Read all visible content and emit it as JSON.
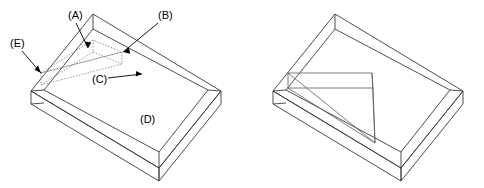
{
  "figure": {
    "background_color": "#ffffff",
    "line_color": "#3a3a3a",
    "hidden_line_color": "#7d7d7d",
    "label_color": "#000000",
    "views": [
      {
        "name": "left-view",
        "description": "Open rectangular tray with hidden (dotted) wedge outline inside"
      },
      {
        "name": "right-view",
        "description": "Open rectangular tray with solid wedge insert inside"
      }
    ]
  },
  "callouts": [
    {
      "id": "A",
      "label": "(A)",
      "text_x": 68,
      "text_y": 16,
      "leader": "M 76 23 L 88 48",
      "head_points": "88,48 84.6,41.6 91.4,42.4",
      "has_leader": true
    },
    {
      "id": "B",
      "label": "(B)",
      "text_x": 158,
      "text_y": 16,
      "leader": "M 158 23 L 123 52",
      "head_points": "123,52 128.8,47.6 130.2,53.8",
      "has_leader": true
    },
    {
      "id": "C",
      "label": "(C)",
      "text_x": 92,
      "text_y": 80,
      "leader": "M 108 78 L 142 74",
      "head_points": "142,74 135.8,76.6 136.2,71.0",
      "has_leader": true
    },
    {
      "id": "D",
      "label": "(D)",
      "text_x": 140,
      "text_y": 120,
      "leader": "",
      "head_points": "",
      "has_leader": false
    },
    {
      "id": "E",
      "label": "(E)",
      "text_x": 10,
      "text_y": 44,
      "leader": "M 22 51 L 41 73",
      "head_points": "41,73 34.6,69.8 38.0,65.6",
      "has_leader": true
    }
  ],
  "geometry": {
    "left_view": {
      "outer_rim_top": "M 31 91 L 93 14 L 221 91 L 159 168 Z",
      "inner_rim_top": "M 44 90 L 93 29 L 208 90 L 159 152 Z",
      "outer_wall_left": "M 31 91 L 31 104 L 159 181 L 159 168 Z",
      "outer_wall_right": "M 159 168 L 159 181 L 221 104 L 221 91 Z",
      "corner_vertical_back": "M 93 14 L 93 29",
      "corner_vertical_left": "M 31 91 L 44 90",
      "corner_vertical_right": "M 221 91 L 208 90",
      "corner_vertical_front": "M 159 168 L 159 152",
      "bottom_left_tick": "M 31 104 L 44 103",
      "wedge_dotted": [
        "M 41 73 L 93 40 L 122 52 Z",
        "M 41 73 L 122 52",
        "M 41 73 L 41 85",
        "M 41 85 L 122 64",
        "M 122 52 L 122 64",
        "M 93 40 L 93 52",
        "M 41 85 L 93 52",
        "M 93 52 L 122 64"
      ]
    },
    "right_view": {
      "outer_rim_top": "M 273 91 L 335 14 L 463 91 L 401 168 Z",
      "inner_rim_top": "M 286 90 L 335 29 L 450 90 L 401 152 Z",
      "outer_wall_left": "M 273 91 L 273 104 L 401 181 L 401 168 Z",
      "outer_wall_right": "M 401 168 L 401 181 L 463 104 L 463 91 Z",
      "corner_vertical_back": "M 335 14 L 335 29",
      "corner_vertical_left": "M 273 91 L 286 90",
      "corner_vertical_right": "M 463 91 L 450 90",
      "corner_vertical_front": "M 401 168 L 401 152",
      "bottom_left_tick": "M 273 104 L 286 103",
      "wedge_solid": [
        "M 288 73 L 372 73 L 375 143 Z",
        "M 288 73 L 288 88",
        "M 288 88 L 373 88",
        "M 372 73 L 373 88",
        "M 288 88 L 375 143",
        "M 373 88 L 375 143"
      ]
    }
  }
}
